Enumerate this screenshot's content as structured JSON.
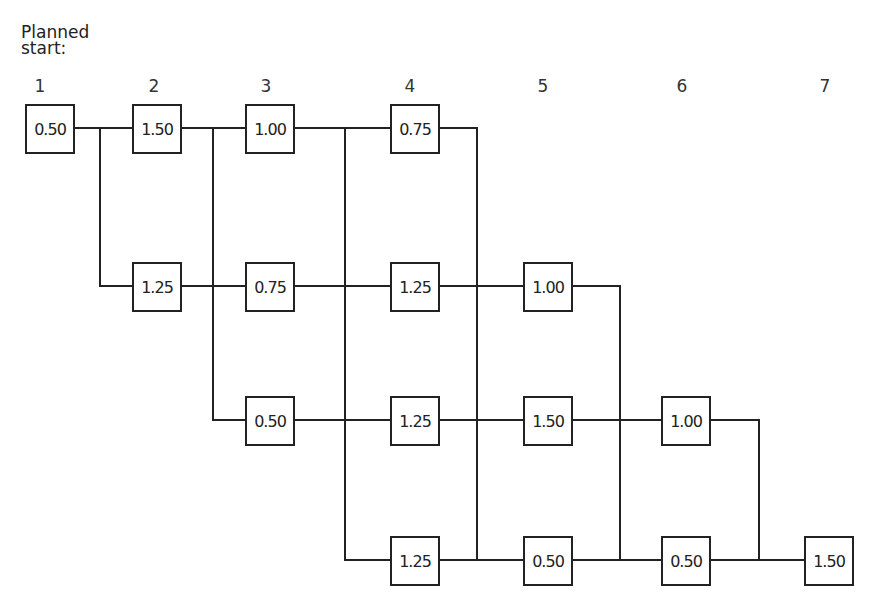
{
  "title_line1": "Planned",
  "title_line2": "start:",
  "columns": [
    "1",
    "2",
    "3",
    "4",
    "5",
    "6",
    "7"
  ],
  "nodes": [
    {
      "id": "r1c1",
      "row": 1,
      "col": 1,
      "value": "0.50"
    },
    {
      "id": "r1c2",
      "row": 1,
      "col": 2,
      "value": "1.50"
    },
    {
      "id": "r1c3",
      "row": 1,
      "col": 3,
      "value": "1.00"
    },
    {
      "id": "r1c4",
      "row": 1,
      "col": 4,
      "value": "0.75"
    },
    {
      "id": "r2c2",
      "row": 2,
      "col": 2,
      "value": "1.25"
    },
    {
      "id": "r2c3",
      "row": 2,
      "col": 3,
      "value": "0.75"
    },
    {
      "id": "r2c4",
      "row": 2,
      "col": 4,
      "value": "1.25"
    },
    {
      "id": "r2c5",
      "row": 2,
      "col": 5,
      "value": "1.00"
    },
    {
      "id": "r3c3",
      "row": 3,
      "col": 3,
      "value": "0.50"
    },
    {
      "id": "r3c4",
      "row": 3,
      "col": 4,
      "value": "1.25"
    },
    {
      "id": "r3c5",
      "row": 3,
      "col": 5,
      "value": "1.50"
    },
    {
      "id": "r3c6",
      "row": 3,
      "col": 6,
      "value": "1.00"
    },
    {
      "id": "r4c4",
      "row": 4,
      "col": 4,
      "value": "1.25"
    },
    {
      "id": "r4c5",
      "row": 4,
      "col": 5,
      "value": "0.50"
    },
    {
      "id": "r4c6",
      "row": 4,
      "col": 6,
      "value": "0.50"
    },
    {
      "id": "r4c7",
      "row": 4,
      "col": 7,
      "value": "1.50"
    }
  ]
}
